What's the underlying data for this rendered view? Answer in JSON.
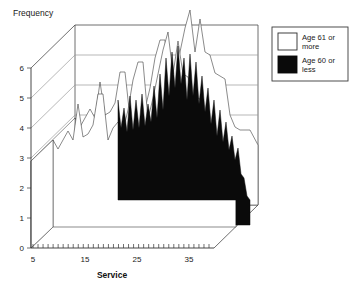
{
  "chart_data": {
    "type": "area",
    "title": "",
    "ylabel": "Frequency",
    "xlabel": "Service",
    "ylim": [
      0,
      6
    ],
    "xlim": [
      5,
      40
    ],
    "yticks": [
      "0",
      "1",
      "2",
      "3",
      "4",
      "5",
      "6"
    ],
    "ytick_values": [
      0,
      1,
      2,
      3,
      4,
      5,
      6
    ],
    "xticks": [
      "5",
      "15",
      "25",
      "35"
    ],
    "xtick_values": [
      5,
      15,
      25,
      35
    ],
    "grid": true,
    "projection": "3d-ribbon",
    "legend_position": "right",
    "series": [
      {
        "name": "Age 61 or more",
        "color": "#ffffff",
        "depth_index": 0,
        "x": [
          5,
          6,
          7,
          8,
          9,
          10,
          11,
          12,
          13,
          14,
          15,
          16,
          17,
          18,
          19,
          20,
          21,
          22,
          23,
          24,
          25,
          26,
          27,
          28,
          29,
          30,
          31,
          32,
          33,
          34,
          35,
          36,
          37,
          38,
          39,
          40
        ],
        "values": [
          2.9,
          2.6,
          3.0,
          3.3,
          3.0,
          4.2,
          3.2,
          3.3,
          3.6,
          4.9,
          4.9,
          3.0,
          3.4,
          3.6,
          3.3,
          4.0,
          5.0,
          5.6,
          5.6,
          3.7,
          4.4,
          5.2,
          6.0,
          6.6,
          5.2,
          6.3,
          5.2,
          5.1,
          4.4,
          4.3,
          4.2,
          3.0,
          2.6,
          2.5,
          2.5,
          2.0
        ]
      },
      {
        "name": "Age 60 or less",
        "color": "#0a0a0a",
        "depth_index": 1,
        "x": [
          5,
          6,
          7,
          8,
          9,
          10,
          11,
          12,
          13,
          14,
          15,
          16,
          17,
          18,
          19,
          20,
          21,
          22,
          23,
          24,
          25,
          26,
          27,
          28,
          29,
          30,
          31,
          32,
          33,
          34,
          35,
          36,
          37,
          38,
          39,
          40
        ],
        "values": [
          0.0,
          0.0,
          0.0,
          0.0,
          0.0,
          0.0,
          0.0,
          0.0,
          0.0,
          0.0,
          0.0,
          0.0,
          0.0,
          0.0,
          4.9,
          3.4,
          4.6,
          3.9,
          5.0,
          4.0,
          4.9,
          4.3,
          6.4,
          5.4,
          5.8,
          5.2,
          6.0,
          4.0,
          3.6,
          4.0,
          3.4,
          4.7,
          3.5,
          2.6,
          1.2,
          1.0
        ]
      }
    ],
    "legend": [
      {
        "label": "Age 61 or more",
        "color": "#ffffff"
      },
      {
        "label": "Age 60 or less",
        "color": "#0a0a0a"
      }
    ]
  },
  "legend": {
    "item_1_line_1": "Age 61 or",
    "item_1_line_2": "more",
    "item_2_line_1": "Age 60 or",
    "item_2_line_2": "less"
  },
  "labels": {
    "y_axis": "Frequency",
    "x_axis": "Service"
  }
}
